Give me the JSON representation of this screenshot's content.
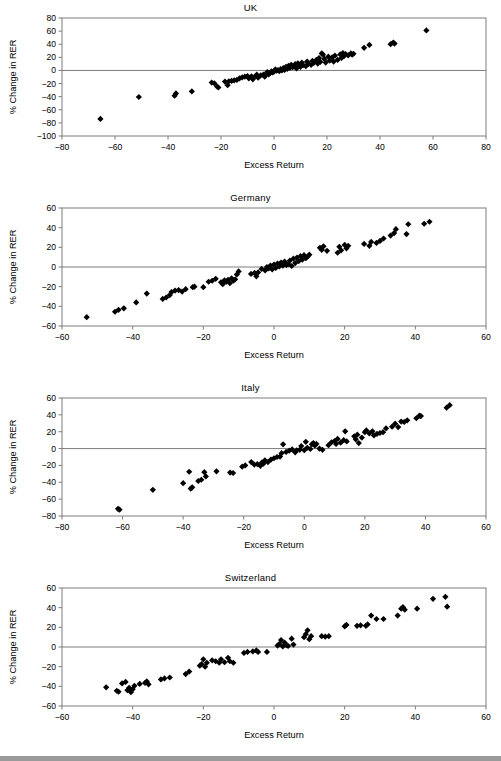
{
  "figure": {
    "background_color": "#ffffff",
    "marker_color": "#000000",
    "axis_color": "#7d7d7d",
    "footer_bar_color": "#9a9a9a",
    "panel_count": 4
  },
  "chart_data": [
    {
      "type": "scatter",
      "title": "UK",
      "xlabel": "Excess Return",
      "ylabel": "% Change in RER",
      "xlim": [
        -80,
        80
      ],
      "ylim": [
        -100,
        80
      ],
      "xticks": [
        -80,
        -60,
        -40,
        -20,
        0,
        20,
        40,
        60,
        80
      ],
      "yticks": [
        -100,
        -80,
        -60,
        -40,
        -20,
        0,
        20,
        40,
        60,
        80
      ],
      "grid": false,
      "legend": "none",
      "marker": "filled-diamond",
      "points": [
        [
          -65.5,
          -74.0
        ],
        [
          -51.0,
          -40.5
        ],
        [
          -37.5,
          -38.5
        ],
        [
          -37.0,
          -35.0
        ],
        [
          -31.0,
          -32.0
        ],
        [
          -23.5,
          -18.5
        ],
        [
          -22.5,
          -19.5
        ],
        [
          -21.5,
          -24.5
        ],
        [
          -21.0,
          -26.0
        ],
        [
          -18.5,
          -17.0
        ],
        [
          -17.5,
          -22.5
        ],
        [
          -17.0,
          -16.5
        ],
        [
          -16.0,
          -16.0
        ],
        [
          -15.0,
          -15.0
        ],
        [
          -14.0,
          -14.5
        ],
        [
          -13.0,
          -12.0
        ],
        [
          -12.0,
          -10.5
        ],
        [
          -11.0,
          -9.5
        ],
        [
          -10.0,
          -8.5
        ],
        [
          -9.5,
          -12.0
        ],
        [
          -8.5,
          -9.0
        ],
        [
          -8.0,
          -13.5
        ],
        [
          -7.0,
          -8.5
        ],
        [
          -6.5,
          -6.5
        ],
        [
          -6.0,
          -11.0
        ],
        [
          -5.0,
          -7.5
        ],
        [
          -4.0,
          -6.5
        ],
        [
          -3.5,
          -9.5
        ],
        [
          -3.0,
          -5.0
        ],
        [
          -2.5,
          -2.5
        ],
        [
          -2.0,
          -6.0
        ],
        [
          -1.5,
          -4.0
        ],
        [
          -1.0,
          -1.5
        ],
        [
          -0.5,
          -3.0
        ],
        [
          0.0,
          -2.0
        ],
        [
          0.5,
          1.5
        ],
        [
          1.0,
          -0.5
        ],
        [
          1.5,
          0.5
        ],
        [
          2.0,
          -1.0
        ],
        [
          2.5,
          2.0
        ],
        [
          3.0,
          0.0
        ],
        [
          3.5,
          3.5
        ],
        [
          4.0,
          1.0
        ],
        [
          4.5,
          5.5
        ],
        [
          5.0,
          2.5
        ],
        [
          5.5,
          7.0
        ],
        [
          6.0,
          4.0
        ],
        [
          6.5,
          8.5
        ],
        [
          7.0,
          5.0
        ],
        [
          7.5,
          6.0
        ],
        [
          8.0,
          9.5
        ],
        [
          8.5,
          3.0
        ],
        [
          9.0,
          11.0
        ],
        [
          9.5,
          7.5
        ],
        [
          10.0,
          5.5
        ],
        [
          10.5,
          12.0
        ],
        [
          11.0,
          8.0
        ],
        [
          12.0,
          6.5
        ],
        [
          12.5,
          13.5
        ],
        [
          13.0,
          10.0
        ],
        [
          14.0,
          8.5
        ],
        [
          14.5,
          14.5
        ],
        [
          15.0,
          11.5
        ],
        [
          16.0,
          16.0
        ],
        [
          16.5,
          10.5
        ],
        [
          17.0,
          19.0
        ],
        [
          17.5,
          13.0
        ],
        [
          18.0,
          26.0
        ],
        [
          18.5,
          24.0
        ],
        [
          19.0,
          17.5
        ],
        [
          19.5,
          12.0
        ],
        [
          20.5,
          21.0
        ],
        [
          21.0,
          15.0
        ],
        [
          22.0,
          20.0
        ],
        [
          22.5,
          13.5
        ],
        [
          23.0,
          22.5
        ],
        [
          24.0,
          16.0
        ],
        [
          25.0,
          24.5
        ],
        [
          25.5,
          19.0
        ],
        [
          26.0,
          26.5
        ],
        [
          26.5,
          22.0
        ],
        [
          27.0,
          25.0
        ],
        [
          28.0,
          23.0
        ],
        [
          29.0,
          26.0
        ],
        [
          29.5,
          24.0
        ],
        [
          30.0,
          25.5
        ],
        [
          34.0,
          34.5
        ],
        [
          36.0,
          39.0
        ],
        [
          44.0,
          40.0
        ],
        [
          45.0,
          42.5
        ],
        [
          45.5,
          41.0
        ],
        [
          57.5,
          61.0
        ]
      ]
    },
    {
      "type": "scatter",
      "title": "Germany",
      "xlabel": "Excess Return",
      "ylabel": "% Change in RER",
      "xlim": [
        -60,
        60
      ],
      "ylim": [
        -60,
        60
      ],
      "xticks": [
        -60,
        -40,
        -20,
        0,
        20,
        40,
        60
      ],
      "yticks": [
        -60,
        -40,
        -20,
        0,
        20,
        40,
        60
      ],
      "grid": false,
      "legend": "none",
      "marker": "filled-diamond",
      "points": [
        [
          -53.0,
          -51.0
        ],
        [
          -45.0,
          -45.5
        ],
        [
          -44.0,
          -43.5
        ],
        [
          -42.5,
          -42.0
        ],
        [
          -39.0,
          -36.0
        ],
        [
          -36.0,
          -27.0
        ],
        [
          -31.5,
          -32.5
        ],
        [
          -30.5,
          -31.0
        ],
        [
          -29.5,
          -28.5
        ],
        [
          -29.0,
          -25.5
        ],
        [
          -28.0,
          -24.0
        ],
        [
          -27.0,
          -23.5
        ],
        [
          -26.0,
          -25.0
        ],
        [
          -25.0,
          -22.5
        ],
        [
          -23.0,
          -20.5
        ],
        [
          -22.5,
          -20.0
        ],
        [
          -20.0,
          -20.5
        ],
        [
          -18.5,
          -15.0
        ],
        [
          -17.5,
          -14.0
        ],
        [
          -16.5,
          -12.0
        ],
        [
          -15.0,
          -15.5
        ],
        [
          -14.5,
          -17.5
        ],
        [
          -14.0,
          -13.5
        ],
        [
          -13.5,
          -15.0
        ],
        [
          -13.0,
          -13.0
        ],
        [
          -12.5,
          -16.5
        ],
        [
          -12.0,
          -11.5
        ],
        [
          -11.5,
          -14.0
        ],
        [
          -11.0,
          -12.5
        ],
        [
          -10.5,
          -7.5
        ],
        [
          -10.0,
          -4.5
        ],
        [
          -6.5,
          -7.0
        ],
        [
          -5.5,
          -6.0
        ],
        [
          -5.0,
          -9.5
        ],
        [
          -4.5,
          -5.5
        ],
        [
          -3.5,
          -2.0
        ],
        [
          -2.5,
          -3.5
        ],
        [
          -2.0,
          0.0
        ],
        [
          -1.5,
          -1.5
        ],
        [
          -1.0,
          1.5
        ],
        [
          -0.5,
          -2.5
        ],
        [
          0.0,
          2.5
        ],
        [
          0.5,
          -1.0
        ],
        [
          1.0,
          3.5
        ],
        [
          1.5,
          0.5
        ],
        [
          2.0,
          4.5
        ],
        [
          2.5,
          1.5
        ],
        [
          3.0,
          5.5
        ],
        [
          3.5,
          2.0
        ],
        [
          4.0,
          3.0
        ],
        [
          4.5,
          6.5
        ],
        [
          5.0,
          1.0
        ],
        [
          5.5,
          8.5
        ],
        [
          6.0,
          4.0
        ],
        [
          6.5,
          9.5
        ],
        [
          7.0,
          6.0
        ],
        [
          7.5,
          11.0
        ],
        [
          8.0,
          7.5
        ],
        [
          8.5,
          12.0
        ],
        [
          9.0,
          9.0
        ],
        [
          9.5,
          10.5
        ],
        [
          10.0,
          12.5
        ],
        [
          13.0,
          19.5
        ],
        [
          13.5,
          17.5
        ],
        [
          14.0,
          21.0
        ],
        [
          15.0,
          16.5
        ],
        [
          18.0,
          14.5
        ],
        [
          18.5,
          20.5
        ],
        [
          19.0,
          17.0
        ],
        [
          20.0,
          22.5
        ],
        [
          20.5,
          19.0
        ],
        [
          21.0,
          21.5
        ],
        [
          25.5,
          23.5
        ],
        [
          27.0,
          21.5
        ],
        [
          27.5,
          25.5
        ],
        [
          29.0,
          24.5
        ],
        [
          30.0,
          26.5
        ],
        [
          31.0,
          29.0
        ],
        [
          33.0,
          32.0
        ],
        [
          34.0,
          34.5
        ],
        [
          34.5,
          38.5
        ],
        [
          37.5,
          33.5
        ],
        [
          38.0,
          43.5
        ],
        [
          42.5,
          44.0
        ],
        [
          44.0,
          46.0
        ]
      ]
    },
    {
      "type": "scatter",
      "title": "Italy",
      "xlabel": "Excess Return",
      "ylabel": "% Change in RER",
      "xlim": [
        -80,
        60
      ],
      "ylim": [
        -80,
        60
      ],
      "xticks": [
        -80,
        -60,
        -40,
        -20,
        0,
        20,
        40,
        60
      ],
      "yticks": [
        -80,
        -60,
        -40,
        -20,
        0,
        20,
        40,
        60
      ],
      "grid": false,
      "legend": "none",
      "marker": "filled-diamond",
      "points": [
        [
          -61.5,
          -71.5
        ],
        [
          -61.0,
          -72.5
        ],
        [
          -50.0,
          -49.0
        ],
        [
          -40.0,
          -41.0
        ],
        [
          -38.0,
          -27.5
        ],
        [
          -37.5,
          -47.5
        ],
        [
          -37.0,
          -46.0
        ],
        [
          -35.0,
          -38.5
        ],
        [
          -34.0,
          -37.0
        ],
        [
          -33.0,
          -28.0
        ],
        [
          -32.5,
          -33.0
        ],
        [
          -29.0,
          -27.0
        ],
        [
          -24.5,
          -28.5
        ],
        [
          -23.5,
          -29.0
        ],
        [
          -20.5,
          -21.5
        ],
        [
          -19.5,
          -20.0
        ],
        [
          -17.5,
          -16.0
        ],
        [
          -16.5,
          -19.0
        ],
        [
          -15.5,
          -18.5
        ],
        [
          -14.5,
          -20.5
        ],
        [
          -14.0,
          -16.5
        ],
        [
          -13.5,
          -18.0
        ],
        [
          -13.0,
          -14.0
        ],
        [
          -12.0,
          -16.0
        ],
        [
          -11.0,
          -13.0
        ],
        [
          -10.0,
          -11.5
        ],
        [
          -9.0,
          -10.0
        ],
        [
          -8.0,
          -9.5
        ],
        [
          -7.5,
          -5.5
        ],
        [
          -7.0,
          5.0
        ],
        [
          -6.0,
          -4.0
        ],
        [
          -5.0,
          -2.5
        ],
        [
          -4.0,
          -1.0
        ],
        [
          -3.0,
          -4.5
        ],
        [
          -2.5,
          -2.0
        ],
        [
          -1.5,
          -1.5
        ],
        [
          -1.0,
          3.0
        ],
        [
          0.0,
          -2.0
        ],
        [
          0.5,
          8.0
        ],
        [
          1.0,
          1.0
        ],
        [
          2.0,
          -0.5
        ],
        [
          2.5,
          5.0
        ],
        [
          3.0,
          6.5
        ],
        [
          3.5,
          3.5
        ],
        [
          4.0,
          5.5
        ],
        [
          5.0,
          0.0
        ],
        [
          6.0,
          -1.5
        ],
        [
          8.0,
          4.0
        ],
        [
          9.0,
          7.5
        ],
        [
          10.0,
          9.0
        ],
        [
          10.5,
          5.5
        ],
        [
          11.0,
          11.5
        ],
        [
          12.0,
          7.0
        ],
        [
          13.0,
          10.0
        ],
        [
          13.5,
          20.5
        ],
        [
          14.0,
          8.5
        ],
        [
          16.5,
          14.5
        ],
        [
          17.0,
          11.0
        ],
        [
          17.5,
          16.5
        ],
        [
          18.0,
          6.5
        ],
        [
          19.0,
          13.0
        ],
        [
          20.0,
          19.5
        ],
        [
          20.5,
          21.5
        ],
        [
          21.5,
          18.0
        ],
        [
          22.5,
          20.5
        ],
        [
          23.0,
          15.5
        ],
        [
          24.0,
          17.5
        ],
        [
          25.0,
          18.5
        ],
        [
          26.0,
          19.5
        ],
        [
          27.0,
          24.0
        ],
        [
          29.0,
          26.0
        ],
        [
          30.0,
          29.5
        ],
        [
          31.0,
          25.5
        ],
        [
          32.0,
          32.0
        ],
        [
          33.0,
          31.5
        ],
        [
          34.0,
          33.5
        ],
        [
          37.0,
          36.0
        ],
        [
          38.0,
          39.0
        ],
        [
          38.5,
          38.5
        ],
        [
          47.0,
          48.5
        ],
        [
          48.0,
          51.5
        ]
      ]
    },
    {
      "type": "scatter",
      "title": "Switzerland",
      "xlabel": "Excess Return",
      "ylabel": "% Change in RER",
      "xlim": [
        -60,
        60
      ],
      "ylim": [
        -60,
        60
      ],
      "xticks": [
        -60,
        -40,
        -20,
        0,
        20,
        40,
        60
      ],
      "yticks": [
        -60,
        -40,
        -20,
        0,
        20,
        40,
        60
      ],
      "grid": false,
      "legend": "none",
      "marker": "filled-diamond",
      "points": [
        [
          -47.5,
          -41.0
        ],
        [
          -44.5,
          -44.5
        ],
        [
          -44.0,
          -45.5
        ],
        [
          -43.0,
          -37.0
        ],
        [
          -42.0,
          -35.5
        ],
        [
          -41.5,
          -44.0
        ],
        [
          -41.0,
          -41.5
        ],
        [
          -40.5,
          -46.0
        ],
        [
          -40.0,
          -43.0
        ],
        [
          -39.5,
          -39.5
        ],
        [
          -38.0,
          -37.5
        ],
        [
          -36.5,
          -36.5
        ],
        [
          -36.0,
          -35.0
        ],
        [
          -35.5,
          -38.0
        ],
        [
          -32.0,
          -33.0
        ],
        [
          -31.0,
          -32.0
        ],
        [
          -29.5,
          -31.0
        ],
        [
          -25.0,
          -27.5
        ],
        [
          -24.0,
          -25.0
        ],
        [
          -21.0,
          -19.0
        ],
        [
          -20.5,
          -17.5
        ],
        [
          -20.0,
          -12.5
        ],
        [
          -19.5,
          -20.0
        ],
        [
          -19.0,
          -16.0
        ],
        [
          -17.5,
          -13.5
        ],
        [
          -16.5,
          -14.5
        ],
        [
          -15.5,
          -16.0
        ],
        [
          -15.0,
          -12.5
        ],
        [
          -14.0,
          -15.5
        ],
        [
          -13.0,
          -11.0
        ],
        [
          -12.5,
          -14.5
        ],
        [
          -11.5,
          -16.0
        ],
        [
          -8.5,
          -6.0
        ],
        [
          -7.5,
          -5.0
        ],
        [
          -6.0,
          -4.5
        ],
        [
          -5.0,
          -3.5
        ],
        [
          -4.5,
          -5.0
        ],
        [
          -2.0,
          -5.0
        ],
        [
          1.0,
          1.5
        ],
        [
          1.5,
          3.0
        ],
        [
          2.0,
          7.0
        ],
        [
          2.5,
          0.5
        ],
        [
          3.0,
          4.5
        ],
        [
          3.5,
          2.0
        ],
        [
          4.0,
          1.0
        ],
        [
          5.0,
          8.5
        ],
        [
          5.5,
          2.5
        ],
        [
          8.5,
          10.0
        ],
        [
          9.0,
          13.0
        ],
        [
          9.5,
          17.0
        ],
        [
          10.0,
          8.0
        ],
        [
          10.5,
          11.0
        ],
        [
          13.5,
          11.0
        ],
        [
          14.5,
          10.5
        ],
        [
          15.5,
          11.0
        ],
        [
          20.0,
          21.0
        ],
        [
          20.5,
          22.5
        ],
        [
          23.5,
          21.5
        ],
        [
          24.5,
          22.0
        ],
        [
          26.0,
          21.5
        ],
        [
          26.5,
          23.0
        ],
        [
          27.5,
          32.0
        ],
        [
          29.0,
          28.5
        ],
        [
          31.0,
          28.5
        ],
        [
          35.0,
          32.0
        ],
        [
          36.0,
          39.0
        ],
        [
          36.5,
          40.5
        ],
        [
          37.0,
          38.0
        ],
        [
          40.5,
          39.0
        ],
        [
          45.0,
          49.0
        ],
        [
          48.5,
          51.0
        ],
        [
          49.0,
          41.0
        ]
      ]
    }
  ]
}
